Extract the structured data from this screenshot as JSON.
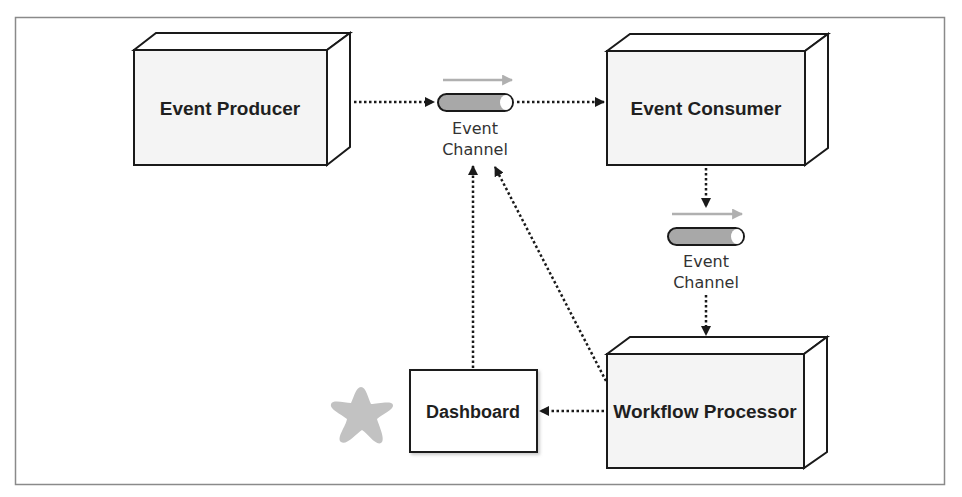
{
  "diagram": {
    "nodes": {
      "event_producer": {
        "label": "Event Producer"
      },
      "event_consumer": {
        "label": "Event Consumer"
      },
      "workflow_processor": {
        "label": "Workflow Processor"
      },
      "dashboard": {
        "label": "Dashboard"
      },
      "channel_top": {
        "line1": "Event",
        "line2": "Channel"
      },
      "channel_right": {
        "line1": "Event",
        "line2": "Channel"
      }
    },
    "edges": [
      {
        "from": "Event Producer",
        "to": "Event Channel (top)"
      },
      {
        "from": "Event Channel (top)",
        "to": "Event Consumer"
      },
      {
        "from": "Event Consumer",
        "to": "Event Channel (right)"
      },
      {
        "from": "Event Channel (right)",
        "to": "Workflow Processor"
      },
      {
        "from": "Workflow Processor",
        "to": "Dashboard"
      },
      {
        "from": "Dashboard",
        "to": "Event Channel (top)"
      },
      {
        "from": "Workflow Processor",
        "to": "Event Channel (top)"
      }
    ],
    "colors": {
      "frame": "#8a8a8a",
      "box_face": "#f4f4f4",
      "box_stroke": "#1a1a1a",
      "channel_fill": "#a8a8a8",
      "flow_arrow": "#b0b0b0",
      "star": "#c2c2c2"
    }
  }
}
